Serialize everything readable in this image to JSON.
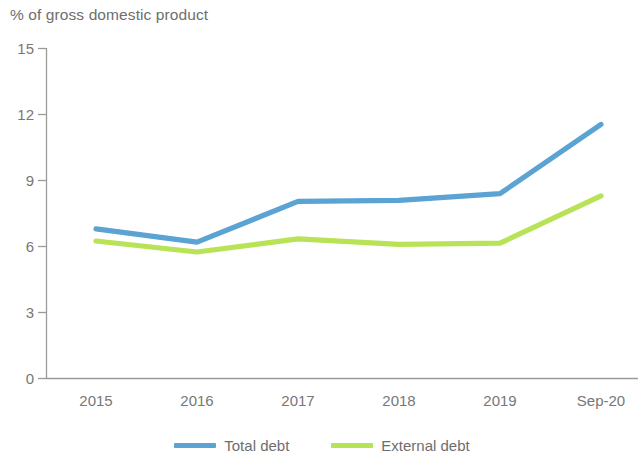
{
  "chart_data": {
    "type": "line",
    "title": "% of gross domestic product",
    "xlabel": "",
    "ylabel": "",
    "categories": [
      "2015",
      "2016",
      "2017",
      "2018",
      "2019",
      "Sep-20"
    ],
    "series": [
      {
        "name": "Total debt",
        "color": "#5ba3d3",
        "values": [
          6.8,
          6.2,
          8.05,
          8.1,
          8.4,
          11.55
        ]
      },
      {
        "name": "External debt",
        "color": "#b9e356",
        "values": [
          6.25,
          5.75,
          6.35,
          6.1,
          6.15,
          8.3
        ]
      }
    ],
    "ylim": [
      0,
      15
    ],
    "yticks": [
      0,
      3,
      6,
      9,
      12,
      15
    ],
    "ytick_labels": [
      "0",
      "3",
      "6",
      "9",
      "12",
      "15"
    ],
    "grid": false,
    "legend_position": "bottom-center"
  },
  "axis": {
    "y_tick_labels": [
      "15",
      "12",
      "9",
      "6",
      "3",
      "0"
    ],
    "x_tick_labels": [
      "2015",
      "2016",
      "2017",
      "2018",
      "2019",
      "Sep-20"
    ]
  },
  "legend": {
    "entries": [
      {
        "label": "Total debt",
        "color": "#5ba3d3"
      },
      {
        "label": "External debt",
        "color": "#b9e356"
      }
    ]
  }
}
